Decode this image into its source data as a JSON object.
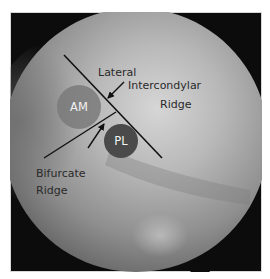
{
  "figure": {
    "labels": {
      "lateral": "Lateral",
      "intercondylar": "Intercondylar",
      "ridge_top": "Ridge",
      "bifurcate": "Bifurcate",
      "ridge_bottom": "Ridge",
      "am": "AM",
      "pl": "PL"
    },
    "colors": {
      "background": "#ffffff",
      "scope_vignette": "#0c0c0c",
      "tissue_light": "#c4c4c4",
      "tissue_mid": "#8e8e8e",
      "bundle_circle": "#6b6b6b",
      "pl_circle": "#4a4a4a",
      "annotation_line": "#111111",
      "label_text": "#2a2a2a",
      "circle_text": "#f2f2f2"
    }
  }
}
